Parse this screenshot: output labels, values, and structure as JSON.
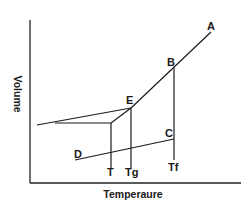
{
  "diagram": {
    "x_axis_label": "Temperaure",
    "y_axis_label": "Volume",
    "point_labels": {
      "A": "A",
      "B": "B",
      "C": "C",
      "D": "D",
      "E": "E"
    },
    "temperature_markers": {
      "T": "T",
      "Tg": "Tg",
      "Tf": "Tf"
    },
    "colors": {
      "line": "#1a1a1a",
      "background": "#ffffff"
    }
  }
}
